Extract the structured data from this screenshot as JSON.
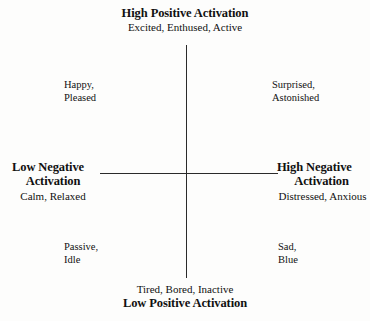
{
  "diagram": {
    "type": "circumplex-model-of-affect",
    "background_color": "#fdfdfc",
    "axis_color": "#2a2a2a",
    "text_color": "#111111"
  },
  "poles": {
    "top": {
      "title": "High Positive Activation",
      "examples": "Excited, Enthused, Active"
    },
    "bottom": {
      "examples": "Tired, Bored, Inactive",
      "title": "Low Positive Activation"
    },
    "left": {
      "title_line1": "Low Negative",
      "title_line2": "Activation",
      "examples": "Calm, Relaxed"
    },
    "right": {
      "title_line1": "High Negative",
      "title_line2": "Activation",
      "examples": "Distressed, Anxious"
    }
  },
  "quadrants": {
    "top_left": {
      "line1": "Happy,",
      "line2": "Pleased"
    },
    "top_right": {
      "line1": "Surprised,",
      "line2": "Astonished"
    },
    "bottom_left": {
      "line1": "Passive,",
      "line2": "Idle"
    },
    "bottom_right": {
      "line1": "Sad,",
      "line2": "Blue"
    }
  },
  "chart_data": {
    "type": "scatter",
    "title": "",
    "xlabel": "Negative Activation",
    "ylabel": "Positive Activation",
    "axis_poles": {
      "top": "High Positive Activation",
      "bottom": "Low Positive Activation",
      "left": "Low Negative Activation",
      "right": "High Negative Activation"
    },
    "annotations": [
      {
        "quadrant": "top-left",
        "text": "Happy, Pleased"
      },
      {
        "quadrant": "top-right",
        "text": "Surprised, Astonished"
      },
      {
        "quadrant": "bottom-left",
        "text": "Passive, Idle"
      },
      {
        "quadrant": "bottom-right",
        "text": "Sad, Blue"
      }
    ],
    "pole_examples": {
      "top": "Excited, Enthused, Active",
      "bottom": "Tired, Bored, Inactive",
      "left": "Calm, Relaxed",
      "right": "Distressed, Anxious"
    },
    "grid": false,
    "legend": "none"
  }
}
